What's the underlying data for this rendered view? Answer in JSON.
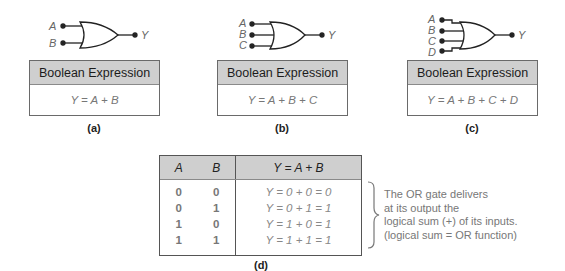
{
  "figures": [
    {
      "id": "a",
      "caption": "(a)",
      "inputs": [
        "A",
        "B"
      ],
      "output": "Y",
      "box_header": "Boolean Expression",
      "expression": "Y = A + B"
    },
    {
      "id": "b",
      "caption": "(b)",
      "inputs": [
        "A",
        "B",
        "C"
      ],
      "output": "Y",
      "box_header": "Boolean Expression",
      "expression": "Y = A + B + C"
    },
    {
      "id": "c",
      "caption": "(c)",
      "inputs": [
        "A",
        "B",
        "C",
        "D"
      ],
      "output": "Y",
      "box_header": "Boolean Expression",
      "expression": "Y = A + B + C + D"
    }
  ],
  "truth_table": {
    "caption": "(d)",
    "headers": [
      "A",
      "B",
      "Y = A + B"
    ],
    "rows": [
      {
        "a": "0",
        "b": "0",
        "y": "Y = 0 + 0 = 0"
      },
      {
        "a": "0",
        "b": "1",
        "y": "Y = 0 + 1 = 1"
      },
      {
        "a": "1",
        "b": "0",
        "y": "Y = 1 + 0 = 1"
      },
      {
        "a": "1",
        "b": "1",
        "y": "Y = 1 + 1 = 1"
      }
    ]
  },
  "note": {
    "lines": [
      "The OR gate delivers",
      "at its output the",
      "logical sum (+) of its inputs.",
      "(logical sum = OR function)"
    ]
  },
  "colors": {
    "header_fill": "#cfcfcf",
    "border": "#6a6a6a",
    "text_gray": "#777777",
    "line": "#222222"
  }
}
